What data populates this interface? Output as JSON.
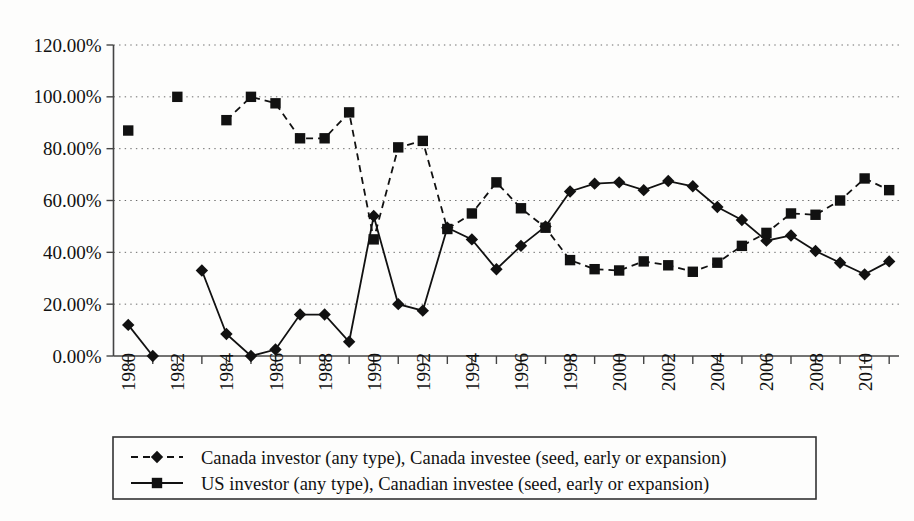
{
  "chart_data": {
    "type": "line",
    "title": "",
    "xlabel": "",
    "ylabel": "",
    "ylim": [
      0,
      120
    ],
    "ytick_labels": [
      "0.00%",
      "20.00%",
      "40.00%",
      "60.00%",
      "80.00%",
      "100.00%",
      "120.00%"
    ],
    "ytick_values": [
      0,
      20,
      40,
      60,
      80,
      100,
      120
    ],
    "grid": true,
    "legend_position": "bottom",
    "x": [
      1980,
      1981,
      1982,
      1983,
      1984,
      1985,
      1986,
      1987,
      1988,
      1989,
      1990,
      1991,
      1992,
      1993,
      1994,
      1995,
      1996,
      1997,
      1998,
      1999,
      2000,
      2001,
      2002,
      2003,
      2004,
      2005,
      2006,
      2007,
      2008,
      2009,
      2010,
      2011
    ],
    "xtick_labels": [
      "1980",
      "1982",
      "1984",
      "1986",
      "1988",
      "1990",
      "1992",
      "1994",
      "1996",
      "1998",
      "2000",
      "2002",
      "2004",
      "2006",
      "2008",
      "2010"
    ],
    "xtick_values": [
      1980,
      1982,
      1984,
      1986,
      1988,
      1990,
      1992,
      1994,
      1996,
      1998,
      2000,
      2002,
      2004,
      2006,
      2008,
      2010
    ],
    "xlim": [
      1979.4,
      2011.4
    ],
    "series": [
      {
        "name": "Canada investor (any type), Canada investee (seed, early or expansion)",
        "marker": "diamond",
        "line_style": "solid",
        "color": "#111111",
        "values": [
          12.0,
          0.0,
          null,
          33.0,
          8.5,
          0.0,
          2.5,
          16.0,
          16.0,
          5.5,
          54.0,
          20.0,
          17.5,
          49.5,
          45.0,
          33.5,
          42.5,
          50.0,
          63.5,
          66.5,
          67.0,
          64.0,
          67.5,
          65.5,
          57.5,
          52.5,
          44.5,
          46.5,
          40.5,
          36.0,
          31.5,
          36.5
        ]
      },
      {
        "name": "US investor (any type), Canadian investee (seed, early or expansion)",
        "marker": "square",
        "line_style": "dashed",
        "color": "#111111",
        "values": [
          87.0,
          null,
          100.0,
          null,
          91.0,
          100.0,
          97.5,
          84.0,
          84.0,
          94.0,
          45.0,
          80.5,
          83.0,
          49.0,
          55.0,
          67.0,
          57.0,
          49.5,
          37.0,
          33.5,
          33.0,
          36.5,
          35.0,
          32.5,
          36.0,
          42.5,
          47.5,
          55.0,
          54.5,
          60.0,
          68.5,
          64.0
        ]
      }
    ],
    "legend_entries": [
      {
        "label": "Canada investor (any type), Canada investee (seed, early or expansion)",
        "marker": "diamond",
        "line_style": "dashed"
      },
      {
        "label": "US investor (any type), Canadian investee (seed, early or expansion)",
        "marker": "square",
        "line_style": "solid"
      }
    ]
  }
}
